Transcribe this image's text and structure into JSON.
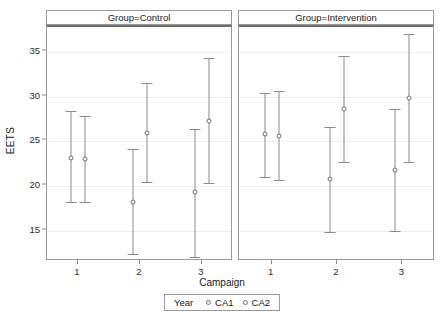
{
  "chart_data": {
    "type": "scatter",
    "title": "",
    "xlabel": "Campaign",
    "ylabel": "EETS",
    "categories": [
      "1",
      "2",
      "3"
    ],
    "ylim": [
      11.5,
      37.8
    ],
    "yticks": [
      15,
      20,
      25,
      30,
      35
    ],
    "grid": true,
    "legend": {
      "title": "Year",
      "position": "bottom",
      "entries": [
        "CA1",
        "CA2"
      ]
    },
    "panels": [
      {
        "label": "Group=Control",
        "series": [
          {
            "name": "CA1",
            "points": [
              {
                "x": "1",
                "mean": 23.1,
                "low": 18.2,
                "high": 28.4
              },
              {
                "x": "2",
                "mean": 18.2,
                "low": 12.4,
                "high": 24.1
              },
              {
                "x": "3",
                "mean": 19.3,
                "low": 12.1,
                "high": 26.4
              }
            ]
          },
          {
            "name": "CA2",
            "points": [
              {
                "x": "1",
                "mean": 23.0,
                "low": 18.2,
                "high": 27.8
              },
              {
                "x": "2",
                "mean": 25.9,
                "low": 20.4,
                "high": 31.5
              },
              {
                "x": "3",
                "mean": 27.3,
                "low": 20.3,
                "high": 34.3
              }
            ]
          }
        ]
      },
      {
        "label": "Group=Intervention",
        "series": [
          {
            "name": "CA1",
            "points": [
              {
                "x": "1",
                "mean": 25.8,
                "low": 21.0,
                "high": 30.4
              },
              {
                "x": "2",
                "mean": 20.8,
                "low": 14.9,
                "high": 26.6
              },
              {
                "x": "3",
                "mean": 21.8,
                "low": 15.0,
                "high": 28.6
              }
            ]
          },
          {
            "name": "CA2",
            "points": [
              {
                "x": "1",
                "mean": 25.6,
                "low": 20.7,
                "high": 30.6
              },
              {
                "x": "2",
                "mean": 28.6,
                "low": 22.7,
                "high": 34.5
              },
              {
                "x": "3",
                "mean": 29.9,
                "low": 22.7,
                "high": 37.0
              }
            ]
          }
        ]
      }
    ]
  }
}
